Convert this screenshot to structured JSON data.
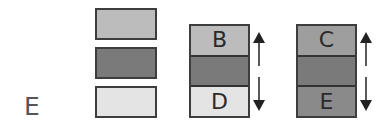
{
  "panel": {
    "label": "E"
  },
  "colors": {
    "light": "#bcbcbc",
    "dark": "#7a7a7a",
    "pale": "#e4e4e4",
    "medium": "#9e9e9e",
    "medium_dark": "#8a8a8a",
    "border": "#3d3d3d",
    "arrow": "#222222"
  },
  "legend_stack": [
    {
      "shade": "light"
    },
    {
      "shade": "dark"
    },
    {
      "shade": "pale"
    }
  ],
  "columns": [
    {
      "segments": [
        {
          "label": "B",
          "shade": "light"
        },
        {
          "label": "",
          "shade": "dark"
        },
        {
          "label": "D",
          "shade": "pale"
        }
      ],
      "arrows": [
        "up",
        "down"
      ]
    },
    {
      "segments": [
        {
          "label": "C",
          "shade": "medium"
        },
        {
          "label": "",
          "shade": "dark"
        },
        {
          "label": "E",
          "shade": "medium_dark"
        }
      ],
      "arrows": [
        "up",
        "down"
      ]
    }
  ]
}
